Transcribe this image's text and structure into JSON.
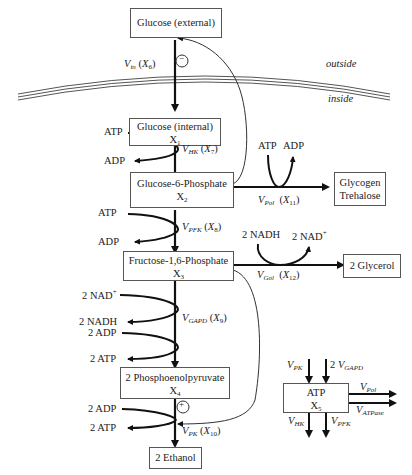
{
  "membrane": {
    "outside_label": "outside",
    "inside_label": "inside"
  },
  "nodes": {
    "glucose_ext": {
      "label": "Glucose (external)"
    },
    "glucose_int": {
      "label": "Glucose (internal)",
      "var": "X",
      "var_sub": "1"
    },
    "g6p": {
      "label": "Glucose-6-Phosphate",
      "var": "X",
      "var_sub": "2"
    },
    "f16p": {
      "label": "Fructose-1,6-Phosphate",
      "var": "X",
      "var_sub": "3"
    },
    "pep": {
      "label": "2 Phosphoenolpyruvate",
      "var": "X",
      "var_sub": "4"
    },
    "ethanol": {
      "label": "2 Ethanol"
    },
    "glycogen": {
      "label1": "Glycogen",
      "label2": "Trehalose"
    },
    "glycerol": {
      "label": "2 Glycerol"
    },
    "atp_pool": {
      "label": "ATP",
      "var": "X",
      "var_sub": "5"
    }
  },
  "reactions": {
    "vin": {
      "v": "V",
      "v_sub": "in",
      "x": "X",
      "x_sub": "6"
    },
    "vhk": {
      "v": "V",
      "v_sub": "HK",
      "x": "X",
      "x_sub": "7"
    },
    "vpfk": {
      "v": "V",
      "v_sub": "PFK",
      "x": "X",
      "x_sub": "8"
    },
    "vgapd": {
      "v": "V",
      "v_sub": "GAPD",
      "x": "X",
      "x_sub": "9"
    },
    "vpk": {
      "v": "V",
      "v_sub": "PK",
      "x": "X",
      "x_sub": "10"
    },
    "vpol": {
      "v": "V",
      "v_sub": "Pol",
      "x": "X",
      "x_sub": "11"
    },
    "vgol": {
      "v": "V",
      "v_sub": "Gol",
      "x": "X",
      "x_sub": "12"
    }
  },
  "cofactors": {
    "hk_in": "ATP",
    "hk_out": "ADP",
    "pfk_in": "ATP",
    "pfk_out": "ADP",
    "gapd_in1": "2 NAD",
    "gapd_in1_sup": "+",
    "gapd_out1": "2 NADH",
    "gapd_in2": "2 ADP",
    "gapd_out2": "2 ATP",
    "pk_in": "2 ADP",
    "pk_out": "2 ATP",
    "pol_in": "ATP",
    "pol_out": "ADP",
    "gol_in": "2 NADH",
    "gol_out": "2 NAD",
    "gol_out_sup": "+"
  },
  "regulation": {
    "inhibition_symbol": "−",
    "activation_symbol": "+"
  },
  "atp_fluxes": {
    "in1": {
      "v": "V",
      "sub": "PK"
    },
    "in2": {
      "prefix": "2 ",
      "v": "V",
      "sub": "GAPD"
    },
    "out1": {
      "v": "V",
      "sub": "Pol"
    },
    "out2": {
      "v": "V",
      "sub": "ATPase"
    },
    "down1": {
      "v": "V",
      "sub": "HK"
    },
    "down2": {
      "v": "V",
      "sub": "PFK"
    }
  }
}
